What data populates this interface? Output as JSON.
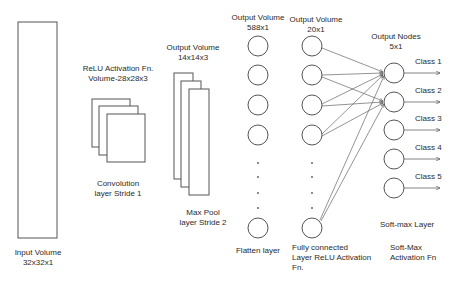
{
  "input_layer": {
    "label_line1": "Input Volume",
    "label_line2": "32x32x1"
  },
  "conv_layer": {
    "top_line1": "ReLU Activation Fn.",
    "top_line2": "Volume-28x28x3",
    "bottom_line1": "Convolution",
    "bottom_line2": "layer Stride 1"
  },
  "pool_layer": {
    "top_line1": "Output Volume",
    "top_line2": "14x14x3",
    "bottom_line1": "Max Pool",
    "bottom_line2": "layer Stride 2"
  },
  "flatten_layer": {
    "top_line1": "Output Volume",
    "top_line2": "588x1",
    "bottom_line1": "Flatten layer"
  },
  "fc_layer": {
    "top_line1": "Output Volume",
    "top_line2": "20x1",
    "bottom_line1": "Fully connected",
    "bottom_line2": "Layer ReLU Activation",
    "bottom_line3": "Fn."
  },
  "output_layer": {
    "top_line1": "Output Nodes",
    "top_line2": "5x1",
    "classes": [
      "Class 1",
      "Class 2",
      "Class 3",
      "Class 4",
      "Class 5"
    ],
    "layer_label": "Soft-max Layer",
    "fn_line1": "Soft-Max",
    "fn_line2": "Activation Fn"
  },
  "colors": {
    "stroke": "#555555",
    "text": "#2a2a2a",
    "background": "#ffffff"
  }
}
